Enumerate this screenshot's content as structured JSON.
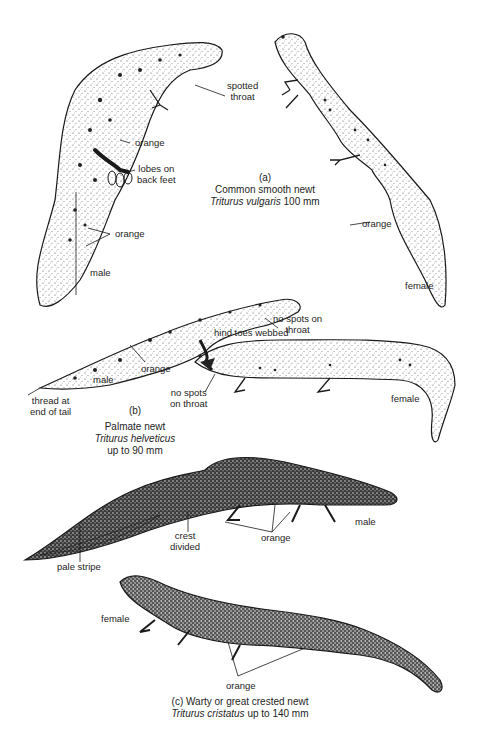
{
  "figure": {
    "ink_color": "#1a1a1a",
    "background": "#ffffff"
  },
  "species": [
    {
      "marker": "(a)",
      "common_name": "Common smooth newt",
      "scientific_name": "Triturus vulgaris",
      "size": "100 mm",
      "labels": {
        "spotted_throat_1": "spotted",
        "spotted_throat_2": "throat",
        "orange_body": "orange",
        "lobes_1": "lobes on",
        "lobes_2": "back feet",
        "orange_tail": "orange",
        "male": "male",
        "orange_female": "orange",
        "female": "female"
      }
    },
    {
      "marker": "(b)",
      "common_name": "Palmate newt",
      "scientific_name": "Triturus helveticus",
      "size": "up to 90 mm",
      "labels": {
        "no_spots_1_a": "no spots on",
        "no_spots_1_b": "throat",
        "hind_toes": "hind toes webbed",
        "orange": "orange",
        "male": "male",
        "thread_1": "thread at",
        "thread_2": "end of tail",
        "no_spots_2_a": "no spots",
        "no_spots_2_b": "on throat",
        "female": "female"
      }
    },
    {
      "marker": "(c)",
      "common_name": "Warty or great crested newt",
      "scientific_name": "Triturus cristatus",
      "size": "up to 140 mm",
      "labels": {
        "crest_1": "crest",
        "crest_2": "divided",
        "orange_male": "orange",
        "male": "male",
        "pale_stripe": "pale stripe",
        "female": "female",
        "orange_female": "orange"
      }
    }
  ]
}
